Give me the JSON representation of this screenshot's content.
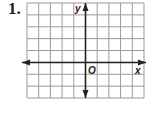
{
  "problem": {
    "number": "1."
  },
  "graph": {
    "x_label": "x",
    "y_label": "y",
    "origin_label": "O",
    "grid_columns": 10,
    "grid_rows": 8,
    "cols_left_of_y_axis": 5,
    "rows_above_x_axis": 5,
    "grid_color": "#9a9a9a",
    "axis_color": "#222222"
  }
}
